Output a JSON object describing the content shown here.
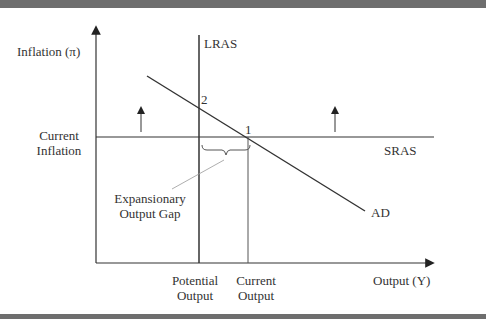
{
  "diagram": {
    "title": "",
    "y_axis_label": "Inflation (π)",
    "x_axis_label": "Output (Y)",
    "curves": {
      "lras": "LRAS",
      "sras": "SRAS",
      "ad": "AD"
    },
    "points": {
      "p1": "1",
      "p2": "2"
    },
    "y_tick": {
      "line1": "Current",
      "line2": "Inflation"
    },
    "x_ticks": {
      "potential_line1": "Potential",
      "potential_line2": "Output",
      "current_line1": "Current",
      "current_line2": "Output"
    },
    "annotation": {
      "line1": "Expansionary",
      "line2": "Output Gap"
    },
    "colors": {
      "line": "#333333",
      "band": "#6e6e6e",
      "leader": "#999999"
    }
  }
}
